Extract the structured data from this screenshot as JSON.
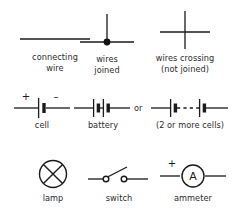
{
  "diagram": {
    "background_color": "#ffffff",
    "ink_color": "#1a1a1a",
    "text_color": "#2b2b2b"
  },
  "rows": [
    {
      "id": "row-wires",
      "items": [
        {
          "id": "connecting-wire",
          "symbol": "plain-horizontal-line",
          "caption_lines": [
            "connecting",
            "wire"
          ]
        },
        {
          "id": "wires-joined",
          "symbol": "tee-junction-with-filled-dot",
          "caption_lines": [
            "wires",
            "joined"
          ]
        },
        {
          "id": "wires-crossing",
          "symbol": "crossing-lines-no-dot",
          "caption_lines": [
            "wires crossing",
            "(not joined)"
          ]
        }
      ]
    },
    {
      "id": "row-cells",
      "items": [
        {
          "id": "cell",
          "symbol": "single-cell-long-short-plate",
          "caption_lines": [
            "cell"
          ],
          "markers": {
            "positive": "+",
            "negative": "–"
          }
        },
        {
          "id": "battery",
          "symbol": "two-cells-in-series",
          "caption_lines": [
            "battery"
          ]
        },
        {
          "id": "multi-cells",
          "symbol": "two-cells-with-dashed-gap",
          "caption_lines": [
            "(2 or more cells)"
          ]
        }
      ],
      "connector_label": "or"
    },
    {
      "id": "row-components",
      "items": [
        {
          "id": "lamp",
          "symbol": "circle-with-diagonal-cross",
          "caption_lines": [
            "lamp"
          ]
        },
        {
          "id": "switch",
          "symbol": "open-switch-two-contacts-and-lever",
          "caption_lines": [
            "switch"
          ]
        },
        {
          "id": "ammeter",
          "symbol": "circle-with-letter-A",
          "caption_lines": [
            "ammeter"
          ],
          "inner_letter": "A",
          "markers": {
            "positive": "+"
          }
        }
      ]
    }
  ]
}
